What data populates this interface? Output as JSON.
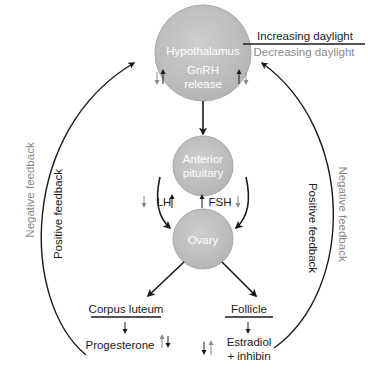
{
  "nodes": {
    "hypothalamus": {
      "label": "Hypothalamus",
      "sub1": "GnRH",
      "sub2": "release"
    },
    "pituitary": {
      "line1": "Anterior",
      "line2": "pituitary"
    },
    "ovary": {
      "label": "Ovary"
    },
    "corpus_luteum": {
      "label": "Corpus luteum",
      "product": "Progesterone"
    },
    "follicle": {
      "label": "Follicle",
      "product1": "Estradiol",
      "product2": "+ inhibin"
    }
  },
  "hormones": {
    "lh": "LH",
    "fsh": "FSH"
  },
  "legend": {
    "increasing": "Increasing daylight",
    "decreasing": "Decreasing daylight"
  },
  "feedback": {
    "left_outer": "Negative feedback",
    "left_inner": "Positive feedback",
    "right_inner": "Positive feedback",
    "right_outer": "Negative feedback"
  },
  "colors": {
    "circle_fill": "#bdbdbd",
    "circle_stroke": "#9e9e9e",
    "dark": "#1a1a1a",
    "gray": "#8a8a8a"
  }
}
